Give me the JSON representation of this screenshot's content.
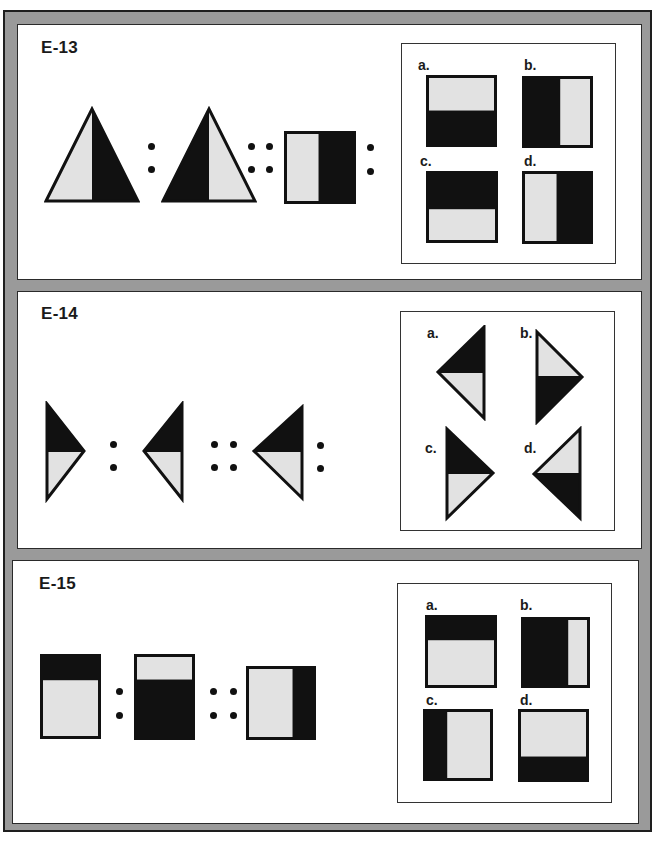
{
  "colors": {
    "frame_gray": "#9a9a9a",
    "dark_fill": "#111111",
    "light_fill": "#e2e2e2",
    "outline": "#111111"
  },
  "items": [
    {
      "id": "E-13",
      "title": "E-13",
      "analogy": {
        "figure_1": "triangle, left half light, right half dark",
        "figure_2": "triangle, left half dark, right half light",
        "figure_3": "square, left half light, right half dark",
        "separator_1": ":",
        "separator_2": "::",
        "separator_3": ":"
      },
      "choices": [
        {
          "label": "a.",
          "description": "square, top light, bottom dark"
        },
        {
          "label": "b.",
          "description": "square, left dark, right light"
        },
        {
          "label": "c.",
          "description": "square, top dark, bottom light"
        },
        {
          "label": "d.",
          "description": "square, left light, right dark"
        }
      ]
    },
    {
      "id": "E-14",
      "title": "E-14",
      "analogy": {
        "figure_1": "right-pointing triangle, top dark, bottom light",
        "figure_2": "left-pointing triangle, top dark, bottom light",
        "figure_3": "left-pointing triangle, top dark, bottom light (larger)",
        "separator_1": ":",
        "separator_2": "::",
        "separator_3": ":"
      },
      "choices": [
        {
          "label": "a.",
          "description": "left-pointing triangle, top dark, bottom light"
        },
        {
          "label": "b.",
          "description": "right-pointing triangle, top light, bottom dark"
        },
        {
          "label": "c.",
          "description": "right-pointing triangle, top dark, bottom light"
        },
        {
          "label": "d.",
          "description": "left-pointing triangle, top light, bottom dark"
        }
      ]
    },
    {
      "id": "E-15",
      "title": "E-15",
      "analogy": {
        "figure_1": "rectangle, top dark strip, bottom light",
        "figure_2": "rectangle, top light strip, bottom dark",
        "figure_3": "rectangle, left light, right dark strip",
        "separator_1": ":",
        "separator_2": "::"
      },
      "choices": [
        {
          "label": "a.",
          "description": "square, top dark strip, bottom light"
        },
        {
          "label": "b.",
          "description": "square, left dark, right light strip"
        },
        {
          "label": "c.",
          "description": "square, left dark strip, right light"
        },
        {
          "label": "d.",
          "description": "square, top light, bottom dark strip"
        }
      ]
    }
  ]
}
